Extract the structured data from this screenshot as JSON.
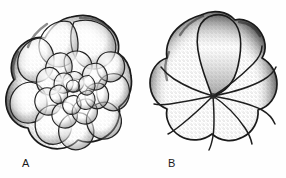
{
  "plate": {
    "background_color": "#ffffff",
    "ink_color": "#1a1a1a",
    "figure_count": 2,
    "medium": "stipple ink drawing"
  },
  "figures": [
    {
      "label": "A",
      "name": "foraminifera-spiral-view",
      "description": "Trochospiral foraminifer test, spiral (dorsal) view showing all chambers of successive whorls in a coiled arrangement",
      "view": "spiral / dorsal",
      "outline_lobed": true,
      "whorl_count": 3,
      "outer_chamber_count": 9,
      "middle_chamber_count": 8,
      "inner_chamber_count": 6,
      "shading": "stipple",
      "center_x": 71,
      "center_y": 88
    },
    {
      "label": "B",
      "name": "foraminifera-umbilical-view",
      "description": "Trochospiral foraminifer test, umbilical (ventral) view showing final whorl chambers radiating from a central umbilicus with an enlarged final chamber",
      "view": "umbilical / ventral",
      "outline_lobed": true,
      "final_whorl_chamber_count": 8,
      "has_enlarged_final_chamber": true,
      "has_central_umbilicus": true,
      "shading": "stipple",
      "center_x": 71,
      "center_y": 95
    }
  ],
  "labels": {
    "a": "A",
    "b": "B"
  }
}
